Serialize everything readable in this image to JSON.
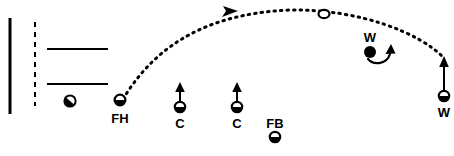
{
  "diagram": {
    "background_color": "#ffffff",
    "ink_color": "#000000",
    "width": 454,
    "height": 156,
    "field_lines": {
      "sideline": {
        "name": "sideline",
        "x": 10,
        "y1": 18,
        "y2": 114,
        "stroke_width": 3,
        "style": "solid"
      },
      "dashed_line": {
        "name": "dashed-vertical-line",
        "x": 35,
        "y1": 22,
        "y2": 106,
        "stroke_width": 2,
        "style": "dashed",
        "dash": "5,5"
      },
      "horizontal_lines": [
        {
          "name": "upper-horizontal-line",
          "x1": 47,
          "x2": 108,
          "y": 49,
          "stroke_width": 2,
          "style": "solid"
        },
        {
          "name": "lower-horizontal-line",
          "x1": 47,
          "x2": 108,
          "y": 84,
          "stroke_width": 2,
          "style": "solid"
        }
      ]
    },
    "players": [
      {
        "id": "goalkeeper",
        "label": "",
        "label_position": "none",
        "marker": "half-filled-circle-diagonal",
        "x": 70,
        "y": 101,
        "r": 5,
        "movement": "none"
      },
      {
        "id": "fh",
        "label": "FH",
        "label_position": "below",
        "marker": "half-filled-circle-bottom",
        "x": 120,
        "y": 100,
        "r": 5,
        "movement": "none"
      },
      {
        "id": "c1",
        "label": "C",
        "label_position": "below",
        "marker": "half-filled-circle-bottom",
        "x": 180,
        "y": 107,
        "r": 5,
        "movement": "arrow-up",
        "arrow_to_y": 84
      },
      {
        "id": "c2",
        "label": "C",
        "label_position": "below",
        "marker": "half-filled-circle-bottom",
        "x": 237,
        "y": 107,
        "r": 5,
        "movement": "arrow-up",
        "arrow_to_y": 84
      },
      {
        "id": "fb",
        "label": "FB",
        "label_position": "above",
        "marker": "half-filled-circle-bottom",
        "x": 275,
        "y": 137,
        "r": 5,
        "movement": "none"
      },
      {
        "id": "w-defender",
        "label": "W",
        "label_position": "above",
        "marker": "filled-circle",
        "x": 370,
        "y": 52,
        "r": 6,
        "movement": "curved-arrow-right"
      },
      {
        "id": "w-receiver",
        "label": "W",
        "label_position": "below",
        "marker": "half-filled-circle-bottom",
        "x": 444,
        "y": 96,
        "r": 5,
        "movement": "arrow-up",
        "arrow_to_y": 57
      }
    ],
    "ball": {
      "id": "ball",
      "marker": "open-circle",
      "x": 324,
      "y": 14,
      "rx": 5,
      "ry": 4
    },
    "pass": {
      "id": "pass-trajectory",
      "style": "dotted",
      "dash": "1.5,5",
      "stroke_width": 3,
      "from": "fh",
      "to": "w-receiver",
      "path": "M 123 99 C 150 55, 195 14, 290 10 C 360 9, 420 33, 444 58",
      "direction_arrow_at": {
        "x": 232,
        "y": 12
      }
    }
  }
}
